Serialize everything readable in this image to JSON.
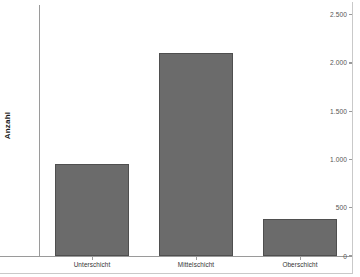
{
  "chart_data": {
    "type": "bar",
    "title": "",
    "subtitle": "",
    "xlabel": "",
    "ylabel": "Anzahl",
    "categories": [
      "Unterschicht",
      "Mittelschicht",
      "Oberschicht"
    ],
    "values": [
      950,
      2100,
      380
    ],
    "ylim": [
      0,
      2600
    ],
    "ytick_values": [
      0,
      500,
      1000,
      1500,
      2000,
      2500
    ],
    "ytick_labels": [
      "0",
      "500",
      "1.000",
      "1.500",
      "2.000",
      "2.500"
    ],
    "grid": false,
    "legend": null,
    "bar_color": "#6b6b6b",
    "bar_edge_color": "#4f4f4f",
    "axis_color": "#9a9a9a",
    "background_color": "#ffffff",
    "annotations": []
  },
  "axis": {
    "y_title": "Anzahl"
  }
}
